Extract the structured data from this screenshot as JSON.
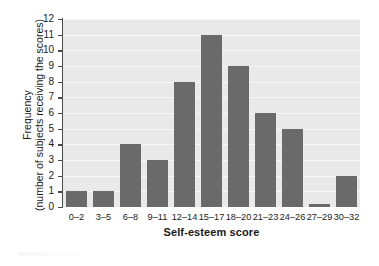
{
  "chart_data": {
    "type": "bar",
    "title": "",
    "xlabel": "Self-esteem score",
    "ylabel_line1": "Frequency",
    "ylabel_line2": "(number of subjects receiving the scores)",
    "categories": [
      "0–2",
      "3–5",
      "6–8",
      "9–11",
      "12–14",
      "15–17",
      "18–20",
      "21–23",
      "24–26",
      "27–29",
      "30–32"
    ],
    "values": [
      1,
      1,
      4,
      3,
      8,
      11,
      9,
      6,
      5,
      0.2,
      2
    ],
    "ylim": [
      0,
      12
    ],
    "ytick_labels": [
      "0",
      "1",
      "2",
      "3",
      "4",
      "5",
      "6",
      "7",
      "8",
      "9",
      "10",
      "11",
      "12"
    ],
    "ytick_values": [
      0,
      1,
      2,
      3,
      4,
      5,
      6,
      7,
      8,
      9,
      10,
      11,
      12
    ],
    "grid": true,
    "grid_axis": "y",
    "legend": false,
    "bar_color": "#6a6a6a",
    "plot_background": "#e9e9e9",
    "gridline_color": "#f7f7f7",
    "axis_color": "#4a4a4a"
  }
}
